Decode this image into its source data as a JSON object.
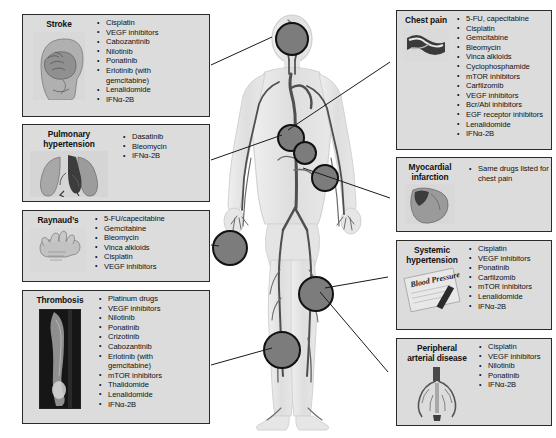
{
  "figure": {
    "alt": "Anatomical diagram of a human body showing the arterial/vascular system with circular markers at brain, chest/heart, hand, and legs"
  },
  "left_boxes": [
    {
      "id": "stroke",
      "title": "Stroke",
      "thumb_name": "brain-head-illustration",
      "drugs": [
        {
          "text": "Cisplatin",
          "continuation": false
        },
        {
          "text": "VEGF inhibitors",
          "continuation": false
        },
        {
          "text": "Cabozantinib",
          "continuation": false
        },
        {
          "text": "Nilotinib",
          "continuation": false
        },
        {
          "text": "Ponatinib",
          "continuation": false
        },
        {
          "text": "Erlotinib (with",
          "continuation": false
        },
        {
          "text": "gemcitabine)",
          "continuation": true
        },
        {
          "text": "Lenalidomide",
          "continuation": false
        },
        {
          "text": "IFNα-2B",
          "continuation": false
        }
      ]
    },
    {
      "id": "pulmonary-hypertension",
      "title": "Pulmonary\nhypertension",
      "thumb_name": "lungs-heart-illustration",
      "drugs": [
        {
          "text": "Dasatinib",
          "continuation": false
        },
        {
          "text": "Bleomycin",
          "continuation": false
        },
        {
          "text": "IFNα-2B",
          "continuation": false
        }
      ]
    },
    {
      "id": "raynauds",
      "title": "Raynaud’s",
      "thumb_name": "hand-illustration",
      "drugs": [
        {
          "text": "5-FU/capecitabine",
          "continuation": false
        },
        {
          "text": "Gemcitabine",
          "continuation": false
        },
        {
          "text": "Bleomycin",
          "continuation": false
        },
        {
          "text": "Vinca alkloids",
          "continuation": false
        },
        {
          "text": "Cisplatin",
          "continuation": false
        },
        {
          "text": "VEGF inhibitors",
          "continuation": false
        }
      ]
    },
    {
      "id": "thrombosis",
      "title": "Thrombosis",
      "thumb_name": "vein-thrombus-ultrasound",
      "drugs": [
        {
          "text": "Platinum drugs",
          "continuation": false
        },
        {
          "text": "VEGF inhibitors",
          "continuation": false
        },
        {
          "text": "Nilotinib",
          "continuation": false
        },
        {
          "text": "Ponatinib",
          "continuation": false
        },
        {
          "text": "Crizotinib",
          "continuation": false
        },
        {
          "text": "Cabozantinib",
          "continuation": false
        },
        {
          "text": "Erlotinib (with",
          "continuation": false
        },
        {
          "text": "gemcitabine)",
          "continuation": true
        },
        {
          "text": "mTOR inhibitors",
          "continuation": false
        },
        {
          "text": "Thalidomide",
          "continuation": false
        },
        {
          "text": "Lenalidomide",
          "continuation": false
        },
        {
          "text": "IFNα-2B",
          "continuation": false
        }
      ]
    }
  ],
  "right_boxes": [
    {
      "id": "chest-pain",
      "title": "Chest pain",
      "thumb_name": "coronary-artery-cross-section",
      "drugs": [
        {
          "text": "5-FU, capecitabine",
          "continuation": false
        },
        {
          "text": "Cisplatin",
          "continuation": false
        },
        {
          "text": "Gemcitabine",
          "continuation": false
        },
        {
          "text": "Bleomycin",
          "continuation": false
        },
        {
          "text": "Vinca alkloids",
          "continuation": false
        },
        {
          "text": "Cyclophosphamide",
          "continuation": false
        },
        {
          "text": "mTOR inhibitors",
          "continuation": false
        },
        {
          "text": "Carfilzomib",
          "continuation": false
        },
        {
          "text": "VEGF inhibitors",
          "continuation": false
        },
        {
          "text": "Bcr/Abl inhibitors",
          "continuation": false
        },
        {
          "text": "EGF receptor inhibitors",
          "continuation": false
        },
        {
          "text": "Lenalidomide",
          "continuation": false
        },
        {
          "text": "IFNα-2B",
          "continuation": false
        }
      ]
    },
    {
      "id": "myocardial-infarction",
      "title": "Myocardial\ninfarction",
      "thumb_name": "heart-illustration",
      "drugs": [
        {
          "text": "Same drugs listed for",
          "continuation": false
        },
        {
          "text": "chest pain",
          "continuation": true
        }
      ]
    },
    {
      "id": "systemic-hypertension",
      "title": "Systemic\nhypertension",
      "thumb_name": "blood-pressure-gauge",
      "thumb_label": "Blood Pressure",
      "drugs": [
        {
          "text": "Cisplatin",
          "continuation": false
        },
        {
          "text": "VEGF inhibitors",
          "continuation": false
        },
        {
          "text": "Ponatinib",
          "continuation": false
        },
        {
          "text": "Carfilzomib",
          "continuation": false
        },
        {
          "text": "mTOR inhibitors",
          "continuation": false
        },
        {
          "text": "Lenalidomide",
          "continuation": false
        },
        {
          "text": "IFNα-2B",
          "continuation": false
        }
      ]
    },
    {
      "id": "peripheral-arterial-disease",
      "title": "Peripheral\narterial disease",
      "thumb_name": "leg-arteries-illustration",
      "drugs": [
        {
          "text": "Cisplatin",
          "continuation": false
        },
        {
          "text": "VEGF inhibitors",
          "continuation": false
        },
        {
          "text": "Nilotinib",
          "continuation": false
        },
        {
          "text": "Ponatinib",
          "continuation": false
        },
        {
          "text": "IFNα-2B",
          "continuation": false
        }
      ]
    }
  ],
  "markers": [
    {
      "id": "marker-brain",
      "name": "body-marker-brain"
    },
    {
      "id": "marker-heart",
      "name": "body-marker-heart"
    },
    {
      "id": "marker-coronary",
      "name": "body-marker-coronary"
    },
    {
      "id": "marker-aorta",
      "name": "body-marker-aorta"
    },
    {
      "id": "marker-hand",
      "name": "body-marker-hand"
    },
    {
      "id": "marker-thigh",
      "name": "body-marker-thigh"
    },
    {
      "id": "marker-calf",
      "name": "body-marker-calf"
    }
  ],
  "colors": {
    "box_fill": "#dcdcdc",
    "box_border": "#2b2b2b",
    "marker_fill": "#7c7c7c",
    "marker_border": "#111111",
    "leader_line": "#1a1a1a",
    "body_fill": "#e2e2e2",
    "vessel": "#5a5a5a"
  }
}
